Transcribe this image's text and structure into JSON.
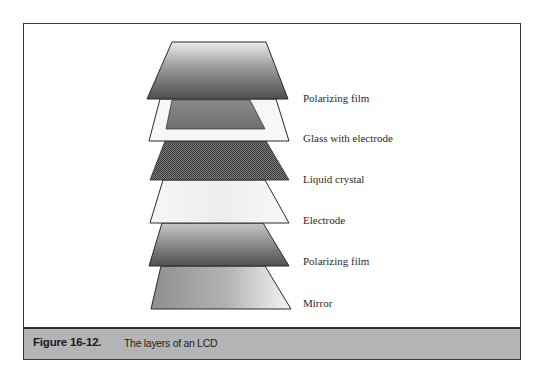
{
  "figure": {
    "number": "Figure 16-12.",
    "caption": "The layers of an LCD"
  },
  "colors": {
    "frame_border": "#3a3a3a",
    "caption_background": "#b4b4b4",
    "layer_outline": "#2a2a2a",
    "polarizing_film_light": "#e6e6e6",
    "polarizing_film_dark": "#555555",
    "glass_frame": "#f7f7f7",
    "glass_electrode": "#7a7a7a",
    "liquid_crystal_dark": "#3c3c3c",
    "liquid_crystal_light": "#8a8a8a",
    "electrode": "#f1f1f1",
    "mirror_dark": "#8c8c8c",
    "mirror_light": "#f0f0f0"
  },
  "layers": [
    {
      "label": "Polarizing film",
      "fill": "gradient-vertical",
      "order": 1
    },
    {
      "label": "Glass with electrode",
      "fill": "frame-with-inner",
      "order": 2
    },
    {
      "label": "Liquid crystal",
      "fill": "checkered",
      "order": 3
    },
    {
      "label": "Electrode",
      "fill": "light",
      "order": 4
    },
    {
      "label": "Polarizing film",
      "fill": "gradient-vertical",
      "order": 5
    },
    {
      "label": "Mirror",
      "fill": "gradient-horizontal",
      "order": 6
    }
  ]
}
